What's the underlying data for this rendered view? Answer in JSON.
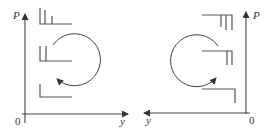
{
  "diagram": {
    "panels": [
      {
        "id": "left",
        "axis_labels": {
          "vertical": "P",
          "horizontal": "y",
          "origin": "0"
        },
        "horizontal_axis_direction": "right",
        "steps": [
          {
            "position": "top",
            "vertical_bars": 3
          },
          {
            "position": "middle",
            "vertical_bars": 2
          },
          {
            "position": "bottom",
            "vertical_bars": 1
          }
        ],
        "cycle_arrow": {
          "direction": "clockwise-open-left",
          "arrowhead_at": "lower-left"
        }
      },
      {
        "id": "right",
        "axis_labels": {
          "vertical": "P",
          "horizontal": "y",
          "origin": "0"
        },
        "horizontal_axis_direction": "left",
        "steps": [
          {
            "position": "top",
            "vertical_bars": 3
          },
          {
            "position": "middle",
            "vertical_bars": 2
          },
          {
            "position": "bottom",
            "vertical_bars": 1
          }
        ],
        "cycle_arrow": {
          "direction": "counterclockwise-open-right",
          "arrowhead_at": "lower-right"
        }
      }
    ],
    "colors": {
      "line": "#444444",
      "background": "#ffffff"
    }
  }
}
